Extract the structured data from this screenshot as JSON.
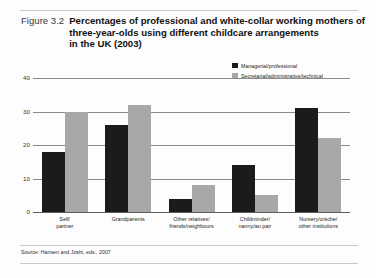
{
  "figure": {
    "number_label": "Figure 3.2",
    "title_lines": [
      "Percentages of professional and white-collar working mothers of",
      "three-year-olds using different childcare arrangements",
      "in the UK (2003)"
    ],
    "source": "Source: Hansen and Joshi, eds., 2007"
  },
  "colors": {
    "series_managerial": "#1b1b1b",
    "series_secretarial": "#a8a8a8",
    "gridline": "#8a8a8a",
    "rule": "#c9c9c9",
    "text": "#231f20"
  },
  "chart_data": {
    "type": "bar",
    "title": "Percentages of professional and white-collar working mothers of three-year-olds using different childcare arrangements in the UK (2003)",
    "xlabel": "",
    "ylabel": "",
    "ylim": [
      0,
      40
    ],
    "yticks": [
      0,
      10,
      20,
      30,
      40
    ],
    "ytick_labels": [
      "0",
      "10",
      "20",
      "30",
      "40"
    ],
    "grid": true,
    "legend_position": "top-right",
    "categories": [
      "Self/\npartner",
      "Grandparents",
      "Other relatives/\nfriends/neighbours",
      "Childminder/\nnanny/au pair",
      "Nursery/crèche/\nother institutions"
    ],
    "category_lines": [
      [
        "Self/",
        "partner"
      ],
      [
        "Grandparents"
      ],
      [
        "Other relatives/",
        "friends/neighbours"
      ],
      [
        "Childminder/",
        "nanny/au pair"
      ],
      [
        "Nursery/crèche/",
        "other institutions"
      ]
    ],
    "series": [
      {
        "name": "Managerial/professional",
        "color": "#1b1b1b",
        "values": [
          18,
          26,
          4,
          14,
          31
        ]
      },
      {
        "name": "Secretarial/administrative/technical",
        "color": "#a8a8a8",
        "values": [
          30,
          32,
          8,
          5,
          22
        ]
      }
    ]
  }
}
